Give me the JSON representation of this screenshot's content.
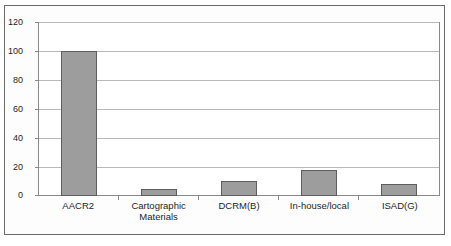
{
  "chart_data": {
    "type": "bar",
    "title": "",
    "subtitle": "",
    "xlabel": "",
    "ylabel": "",
    "categories": [
      "AACR2",
      "Cartographic Materials",
      "DCRM(B)",
      "In-house/local",
      "ISAD(G)"
    ],
    "category_lines": [
      [
        "AACR2"
      ],
      [
        "Cartographic",
        "Materials"
      ],
      [
        "DCRM(B)"
      ],
      [
        "In-house/local"
      ],
      [
        "ISAD(G)"
      ]
    ],
    "values": [
      100,
      5,
      10,
      18,
      8
    ],
    "ylim": [
      0,
      120
    ],
    "ytick_step": 20,
    "yticks": [
      0,
      20,
      40,
      60,
      80,
      100,
      120
    ],
    "ytick_labels": [
      "0",
      "20",
      "40",
      "60",
      "80",
      "100",
      "120"
    ],
    "grid": true,
    "grid_axis": "y",
    "legend": false,
    "legend_position": "none",
    "series": [
      {
        "name": "Count",
        "values": [
          100,
          5,
          10,
          18,
          8
        ]
      }
    ]
  },
  "style": {
    "bar_fill": "#9d9d9d",
    "bar_border": "#5e5e5e",
    "gridline_color": "#b9b9b9",
    "axis_color": "#8a8a8a",
    "frame_color": "#6b6b6b",
    "text_color": "#1d1d1d",
    "background": "#ffffff"
  }
}
